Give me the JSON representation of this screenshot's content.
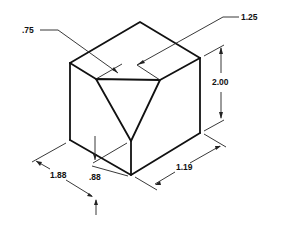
{
  "figure": {
    "type": "isometric technical drawing",
    "dimensions": {
      "top_cut_left": ".75",
      "top_cut_right": "1.25",
      "height": "2.00",
      "left_width": "1.88",
      "right_width": "1.19",
      "cut_depth": ".88"
    }
  }
}
